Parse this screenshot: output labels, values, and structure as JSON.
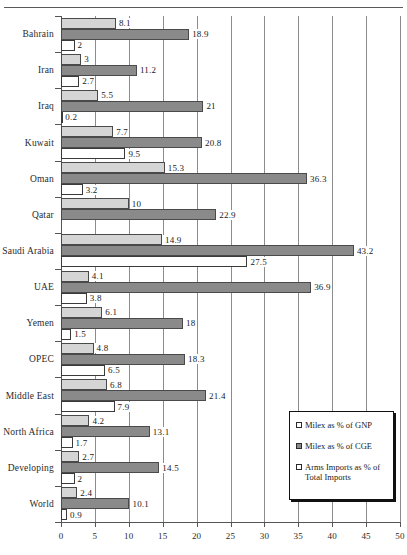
{
  "chart_data": {
    "type": "bar",
    "orientation": "horizontal",
    "title": "",
    "xlabel": "",
    "ylabel": "",
    "xlim": [
      0,
      50
    ],
    "xticks": [
      0,
      5,
      10,
      15,
      20,
      25,
      30,
      35,
      40,
      45,
      50
    ],
    "grid": true,
    "legend_position": "bottom-right",
    "categories": [
      "Bahrain",
      "Iran",
      "Iraq",
      "Kuwait",
      "Oman",
      "Qatar",
      "Saudi Arabia",
      "UAE",
      "Yemen",
      "OPEC",
      "Middle East",
      "North Africa",
      "Developing",
      "World"
    ],
    "series": [
      {
        "name": "Milex as % of GNP",
        "color": "#d5d5d5",
        "values": [
          8.1,
          3,
          5.5,
          7.7,
          15.3,
          10,
          14.9,
          4.1,
          6.1,
          4.8,
          6.8,
          4.2,
          2.7,
          2.4
        ],
        "labels": [
          "8.1",
          "3",
          "5.5",
          "7.7",
          "15.3",
          "10",
          "14.9",
          "4.1",
          "6.1",
          "4.8",
          "6.8",
          "4.2",
          "2.7",
          "2.4"
        ]
      },
      {
        "name": "Milex as % of CGE",
        "color": "#8a8a8a",
        "values": [
          18.9,
          11.2,
          21,
          20.8,
          36.3,
          22.9,
          43.2,
          36.9,
          18,
          18.3,
          21.4,
          13.1,
          14.5,
          10.1
        ],
        "labels": [
          "18.9",
          "11.2",
          "21",
          "20.8",
          "36.3",
          "22.9",
          "43.2",
          "36.9",
          "18",
          "18.3",
          "21.4",
          "13.1",
          "14.5",
          "10.1"
        ]
      },
      {
        "name": "Arms Imports as % of Total Imports",
        "color": "#ffffff",
        "values": [
          2,
          2.7,
          0.2,
          9.5,
          3.2,
          null,
          27.5,
          3.8,
          1.5,
          6.5,
          7.9,
          1.7,
          2,
          0.9
        ],
        "labels": [
          "2",
          "2.7",
          "0.2",
          "9.5",
          "3.2",
          "",
          "27.5",
          "3.8",
          "1.5",
          "6.5",
          "7.9",
          "1.7",
          "2",
          "0.9"
        ]
      }
    ],
    "legend": [
      {
        "label": "Milex as % of GNP",
        "swatch": "open-square"
      },
      {
        "label": "Milex as % of CGE",
        "swatch": "filled-square"
      },
      {
        "label": "Arms Imports as % of Total Imports",
        "swatch": "open-square"
      }
    ]
  }
}
